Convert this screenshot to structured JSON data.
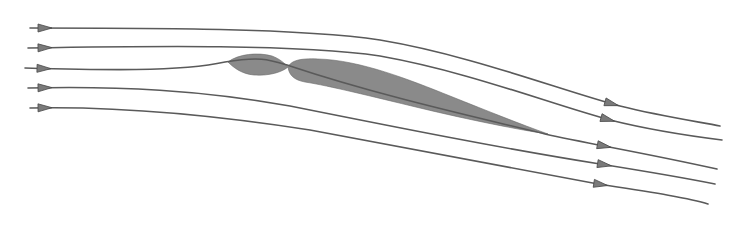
{
  "diagram": {
    "type": "streamline flow around a deflected body",
    "colors": {
      "stroke": "#5a5a5a",
      "fill": "#8a8a8a",
      "arrow": "#7a7a7a",
      "background": "#ffffff"
    },
    "streamlines": [
      {
        "id": 1,
        "path": "M30,28 C150,28 300,28 380,40 C470,55 560,90 620,106 C660,116 700,122 720,126",
        "arrow_in": [
          44,
          28
        ],
        "arrow_out": [
          611,
          104
        ]
      },
      {
        "id": 2,
        "path": "M28,48 C150,46 300,44 380,56 C470,72 550,104 610,120 C650,130 690,136 722,140",
        "arrow_in": [
          44,
          48
        ],
        "arrow_out": [
          607,
          121
        ]
      },
      {
        "id": 3,
        "path": "M25,68 C100,70 180,72 225,62 C262,56 270,60 290,66 C380,96 480,118 545,134 C590,144 640,152 717,169",
        "arrow_in": [
          44,
          68
        ],
        "arrow_out": [
          603,
          146
        ]
      },
      {
        "id": 4,
        "path": "M28,88 C120,86 200,90 290,106 C400,128 500,148 600,164 C650,172 690,179 715,184",
        "arrow_in": [
          44,
          88
        ],
        "arrow_out": [
          602,
          168
        ]
      },
      {
        "id": 5,
        "path": "M30,108 C120,106 220,116 310,130 C420,150 520,170 598,184 C650,192 690,198 708,204",
        "arrow_in": [
          44,
          108
        ],
        "arrow_out": [
          599,
          186
        ]
      }
    ],
    "bodies": [
      {
        "id": "front-lobe",
        "path": "M228,62 C238,54 258,52 272,56 C280,59 284,63 288,67 C282,72 270,76 254,75 C242,74 234,68 228,62 Z"
      },
      {
        "id": "main-body",
        "path": "M288,67 C291,61 299,58 318,59 C360,60 410,80 450,96 C490,112 520,124 548,134 C520,130 470,120 420,108 C370,96 330,86 305,82 C294,80 289,75 288,67 Z"
      }
    ]
  }
}
